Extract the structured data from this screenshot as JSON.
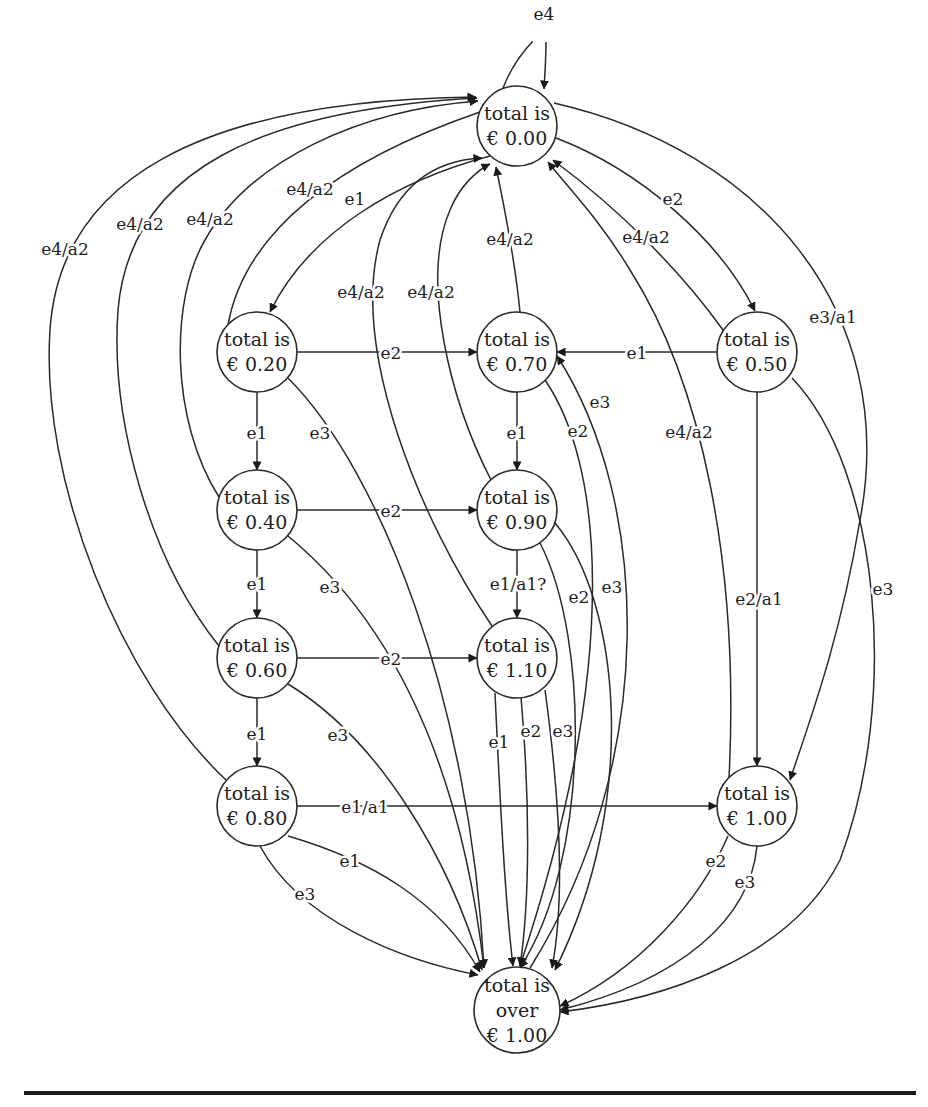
{
  "figure": {
    "type": "state-transition-diagram",
    "colors": {
      "stroke": "#2a2a2a",
      "text": "#1e1e1e",
      "background": "#ffffff",
      "rule": "#1a1a1a"
    }
  },
  "states": [
    {
      "id": "s000",
      "line1": "total is",
      "line2": "€ 0.00",
      "cx": 517,
      "cy": 126,
      "r": 40
    },
    {
      "id": "s020",
      "line1": "total is",
      "line2": "€ 0.20",
      "cx": 257,
      "cy": 352,
      "r": 40
    },
    {
      "id": "s070",
      "line1": "total is",
      "line2": "€ 0.70",
      "cx": 517,
      "cy": 352,
      "r": 40
    },
    {
      "id": "s050",
      "line1": "total is",
      "line2": "€ 0.50",
      "cx": 757,
      "cy": 352,
      "r": 40
    },
    {
      "id": "s040",
      "line1": "total is",
      "line2": "€ 0.40",
      "cx": 257,
      "cy": 510,
      "r": 40
    },
    {
      "id": "s090",
      "line1": "total is",
      "line2": "€ 0.90",
      "cx": 517,
      "cy": 510,
      "r": 40
    },
    {
      "id": "s060",
      "line1": "total is",
      "line2": "€ 0.60",
      "cx": 257,
      "cy": 658,
      "r": 40
    },
    {
      "id": "s110",
      "line1": "total is",
      "line2": "€ 1.10",
      "cx": 517,
      "cy": 658,
      "r": 40
    },
    {
      "id": "s080",
      "line1": "total is",
      "line2": "€ 0.80",
      "cx": 257,
      "cy": 806,
      "r": 40
    },
    {
      "id": "s100",
      "line1": "total is",
      "line2": "€ 1.00",
      "cx": 757,
      "cy": 806,
      "r": 40
    },
    {
      "id": "sover",
      "line1": "total is",
      "line2": "over",
      "line3": "€ 1.00",
      "cx": 517,
      "cy": 1010,
      "r": 43
    }
  ],
  "transitions": [
    {
      "from": "s000",
      "to": "s000",
      "label": "e4"
    },
    {
      "from": "s000",
      "to": "s020",
      "label": "e1"
    },
    {
      "from": "s000",
      "to": "s050",
      "label": "e2"
    },
    {
      "from": "s000",
      "to": "s100",
      "label": "e3/a1"
    },
    {
      "from": "s020",
      "to": "s000",
      "label": "e4/a2"
    },
    {
      "from": "s040",
      "to": "s000",
      "label": "e4/a2"
    },
    {
      "from": "s060",
      "to": "s000",
      "label": "e4/a2"
    },
    {
      "from": "s080",
      "to": "s000",
      "label": "e4/a2"
    },
    {
      "from": "s070",
      "to": "s000",
      "label": "e4/a2"
    },
    {
      "from": "s090",
      "to": "s000",
      "label": "e4/a2"
    },
    {
      "from": "s110",
      "to": "s000",
      "label": "e4/a2"
    },
    {
      "from": "s050",
      "to": "s000",
      "label": "e4/a2"
    },
    {
      "from": "s100",
      "to": "s000",
      "label": "e4/a2"
    },
    {
      "from": "s020",
      "to": "s070",
      "label": "e2"
    },
    {
      "from": "s050",
      "to": "s070",
      "label": "e1"
    },
    {
      "from": "s020",
      "to": "s040",
      "label": "e1"
    },
    {
      "from": "s020",
      "to": "sover",
      "label": "e3"
    },
    {
      "from": "s070",
      "to": "s090",
      "label": "e1"
    },
    {
      "from": "s070",
      "to": "sover",
      "label": "e2"
    },
    {
      "from": "sover",
      "to": "s070",
      "label": "e3"
    },
    {
      "from": "s050",
      "to": "s100",
      "label": "e2/a1"
    },
    {
      "from": "s050",
      "to": "sover",
      "label": "e3"
    },
    {
      "from": "s040",
      "to": "s090",
      "label": "e2"
    },
    {
      "from": "s040",
      "to": "s060",
      "label": "e1"
    },
    {
      "from": "s040",
      "to": "sover",
      "label": "e3"
    },
    {
      "from": "s090",
      "to": "s110",
      "label": "e1/a1?"
    },
    {
      "from": "s090",
      "to": "sover",
      "label": "e2"
    },
    {
      "from": "s090",
      "to": "sover",
      "label": "e3"
    },
    {
      "from": "s060",
      "to": "s110",
      "label": "e2"
    },
    {
      "from": "s060",
      "to": "s080",
      "label": "e1"
    },
    {
      "from": "s060",
      "to": "sover",
      "label": "e3"
    },
    {
      "from": "s110",
      "to": "sover",
      "label": "e1"
    },
    {
      "from": "s110",
      "to": "sover",
      "label": "e2"
    },
    {
      "from": "s110",
      "to": "sover",
      "label": "e3"
    },
    {
      "from": "s080",
      "to": "s100",
      "label": "e1/a1"
    },
    {
      "from": "s080",
      "to": "sover",
      "label": "e1"
    },
    {
      "from": "s080",
      "to": "sover",
      "label": "e3"
    },
    {
      "from": "s100",
      "to": "sover",
      "label": "e2"
    },
    {
      "from": "s100",
      "to": "sover",
      "label": "e3"
    }
  ],
  "labels": {
    "self_e4": "e4",
    "s000_s020_e1": "e1",
    "s000_s050_e2": "e2",
    "s000_s100_e3a1": "e3/a1",
    "s080_s000_e4a2": "e4/a2",
    "s060_s000_e4a2": "e4/a2",
    "s040_s000_e4a2": "e4/a2",
    "s020_s000_e4a2": "e4/a2",
    "s110_s000_e4a2": "e4/a2",
    "s090_s000_e4a2": "e4/a2",
    "s070_s000_e4a2": "e4/a2",
    "s050_s000_e4a2": "e4/a2",
    "s100_s000_e4a2": "e4/a2",
    "s020_s070_e2": "e2",
    "s050_s070_e1": "e1",
    "s020_s040_e1": "e1",
    "s020_over_e3": "e3",
    "s070_s090_e1": "e1",
    "s070_over_e2": "e2",
    "over_s070_e3": "e3",
    "s050_s100_e2a1": "e2/a1",
    "s050_over_e3": "e3",
    "s040_s090_e2": "e2",
    "s040_s060_e1": "e1",
    "s040_over_e3": "e3",
    "s090_s110_e1a1": "e1/a1?",
    "s090_over_e2": "e2",
    "s090_over_e3": "e3",
    "s060_s110_e2": "e2",
    "s060_s080_e1": "e1",
    "s060_over_e3": "e3",
    "s110_over_e1": "e1",
    "s110_over_e2": "e2",
    "s110_over_e3": "e3",
    "s080_s100_e1a1": "e1/a1",
    "s080_over_e1": "e1",
    "s080_over_e3": "e3",
    "s100_over_e2": "e2",
    "s100_over_e3": "e3"
  }
}
